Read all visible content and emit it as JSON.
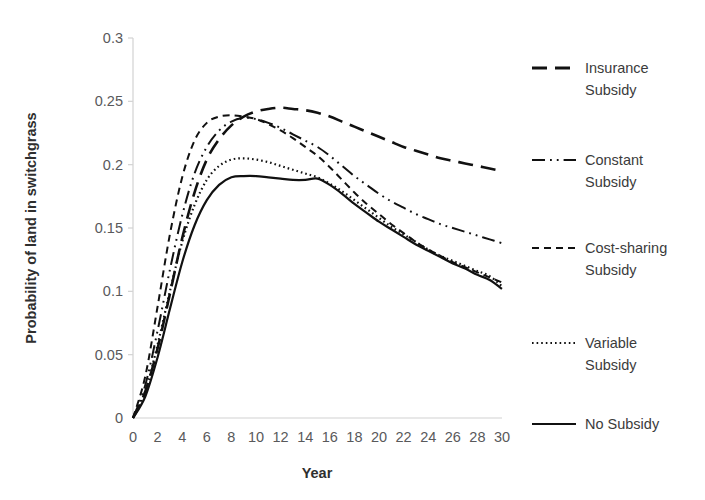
{
  "chart_data": {
    "type": "line",
    "title": "",
    "xlabel": "Year",
    "ylabel": "Probability of land in switchgrass",
    "xlim": [
      0,
      30
    ],
    "ylim": [
      0,
      0.3
    ],
    "grid": false,
    "legend_position": "right",
    "x_ticks": [
      "0",
      "2",
      "4",
      "6",
      "8",
      "10",
      "12",
      "14",
      "16",
      "18",
      "20",
      "22",
      "24",
      "26",
      "28",
      "30"
    ],
    "x_tick_values": [
      0,
      2,
      4,
      6,
      8,
      10,
      12,
      14,
      16,
      18,
      20,
      22,
      24,
      26,
      28,
      30
    ],
    "y_ticks": [
      "0",
      "0.05",
      "0.1",
      "0.15",
      "0.2",
      "0.25",
      "0.3"
    ],
    "y_tick_values": [
      0,
      0.05,
      0.1,
      0.15,
      0.2,
      0.25,
      0.3
    ],
    "x": [
      0,
      1,
      2,
      3,
      4,
      5,
      6,
      7,
      8,
      9,
      10,
      11,
      12,
      13,
      14,
      15,
      16,
      17,
      18,
      19,
      20,
      21,
      22,
      23,
      24,
      25,
      26,
      27,
      28,
      29,
      30
    ],
    "series": [
      {
        "name": "Insurance Subsidy",
        "dash": "long-dash",
        "color": "#111111",
        "width": 2.6,
        "values": [
          0.0,
          0.021,
          0.055,
          0.098,
          0.142,
          0.178,
          0.204,
          0.22,
          0.231,
          0.238,
          0.242,
          0.244,
          0.245,
          0.244,
          0.243,
          0.241,
          0.238,
          0.234,
          0.23,
          0.226,
          0.222,
          0.218,
          0.214,
          0.211,
          0.208,
          0.205,
          0.203,
          0.201,
          0.199,
          0.197,
          0.195
        ]
      },
      {
        "name": "Constant Subsidy",
        "dash": "dash-dot-dot",
        "color": "#111111",
        "width": 2.0,
        "values": [
          0.0,
          0.026,
          0.069,
          0.117,
          0.16,
          0.193,
          0.214,
          0.227,
          0.234,
          0.237,
          0.236,
          0.233,
          0.229,
          0.224,
          0.219,
          0.214,
          0.207,
          0.199,
          0.191,
          0.184,
          0.177,
          0.171,
          0.166,
          0.161,
          0.157,
          0.153,
          0.15,
          0.147,
          0.144,
          0.141,
          0.138
        ]
      },
      {
        "name": "Cost-sharing Subsidy",
        "dash": "short-dash",
        "color": "#111111",
        "width": 2.0,
        "values": [
          0.0,
          0.033,
          0.088,
          0.145,
          0.19,
          0.219,
          0.233,
          0.238,
          0.239,
          0.238,
          0.236,
          0.232,
          0.227,
          0.221,
          0.214,
          0.207,
          0.198,
          0.188,
          0.178,
          0.169,
          0.161,
          0.153,
          0.146,
          0.139,
          0.133,
          0.128,
          0.123,
          0.119,
          0.115,
          0.111,
          0.107
        ]
      },
      {
        "name": "Variable Subsidy",
        "dash": "dotted",
        "color": "#111111",
        "width": 2.2,
        "values": [
          0.0,
          0.021,
          0.058,
          0.1,
          0.139,
          0.168,
          0.188,
          0.199,
          0.204,
          0.205,
          0.204,
          0.202,
          0.199,
          0.196,
          0.193,
          0.19,
          0.185,
          0.179,
          0.172,
          0.165,
          0.158,
          0.151,
          0.145,
          0.139,
          0.133,
          0.128,
          0.124,
          0.12,
          0.116,
          0.112,
          0.104
        ]
      },
      {
        "name": "No Subsidy",
        "dash": "solid",
        "color": "#111111",
        "width": 2.2,
        "values": [
          0.0,
          0.017,
          0.048,
          0.086,
          0.123,
          0.152,
          0.172,
          0.184,
          0.19,
          0.191,
          0.191,
          0.19,
          0.189,
          0.188,
          0.188,
          0.189,
          0.184,
          0.177,
          0.169,
          0.162,
          0.155,
          0.149,
          0.143,
          0.137,
          0.132,
          0.127,
          0.122,
          0.118,
          0.113,
          0.109,
          0.102
        ]
      }
    ]
  },
  "legend": {
    "entries": [
      {
        "label_line1": "Insurance",
        "label_line2": "Subsidy",
        "dash": "long-dash"
      },
      {
        "label_line1": "Constant",
        "label_line2": "Subsidy",
        "dash": "dash-dot-dot"
      },
      {
        "label_line1": "Cost-sharing",
        "label_line2": "Subsidy",
        "dash": "short-dash"
      },
      {
        "label_line1": "Variable",
        "label_line2": "Subsidy",
        "dash": "dotted"
      },
      {
        "label_line1": "No Subsidy",
        "label_line2": "",
        "dash": "solid"
      }
    ]
  },
  "axes": {
    "x_title": "Year",
    "y_title": "Probability of land in switchgrass",
    "axis_color": "#d2d2d2",
    "text_color": "#59595b"
  }
}
